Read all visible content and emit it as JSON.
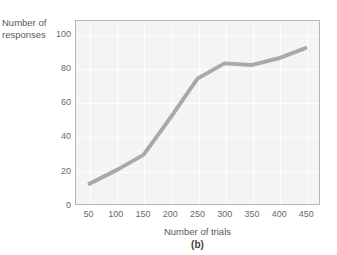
{
  "chart_data": {
    "type": "line",
    "title": "",
    "panel_label": "(b)",
    "xlabel": "Number of trials",
    "ylabel": "Number of\nresponses",
    "x": [
      50,
      100,
      150,
      200,
      250,
      300,
      350,
      400,
      450
    ],
    "xtick_labels": [
      "50",
      "100",
      "150",
      "200",
      "250",
      "300",
      "350",
      "400",
      "450"
    ],
    "ytick_labels": [
      "0",
      "20",
      "40",
      "60",
      "80",
      "100"
    ],
    "yticks": [
      0,
      20,
      40,
      60,
      80,
      100
    ],
    "values": [
      12,
      20,
      29,
      51,
      74,
      83,
      82,
      86,
      92
    ],
    "series": [
      {
        "name": "responses",
        "values": [
          12,
          20,
          29,
          51,
          74,
          83,
          82,
          86,
          92
        ]
      }
    ],
    "xlim": [
      25,
      475
    ],
    "ylim": [
      0,
      108
    ],
    "grid": true,
    "legend": "none",
    "line_color": "#a9a9a9",
    "line_width": 4,
    "plot_background": "#f4f4f4",
    "grid_color": "#ffffff",
    "frame_color": "#b6b6b6",
    "tick_label_color": "#6a6a6a",
    "axis_title_color": "#585858"
  }
}
